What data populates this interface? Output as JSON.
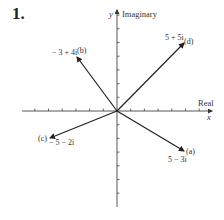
{
  "problem": {
    "number": "1."
  },
  "axes": {
    "x_label": "Real",
    "x_var": "x",
    "y_label": "Imaginary",
    "y_var": "y",
    "unit_px": 13.7,
    "origin": [
      117,
      111
    ],
    "x_ticks": [
      -6,
      -5,
      -4,
      -3,
      -2,
      -1,
      1,
      2,
      3,
      4,
      5,
      6
    ],
    "y_ticks": [
      -7,
      -6,
      -5,
      -4,
      -3,
      -2,
      -1,
      1,
      2,
      3,
      4,
      5,
      6,
      7
    ]
  },
  "vectors": [
    {
      "id": "a",
      "tag": "(a)",
      "expr": "5 − 3i",
      "re": 5,
      "im": -3
    },
    {
      "id": "b",
      "tag": "(b)",
      "expr": "− 3 + 4i",
      "re": -3,
      "im": 4
    },
    {
      "id": "c",
      "tag": "(c)",
      "expr": "− 5  − 2i",
      "re": -5,
      "im": -2
    },
    {
      "id": "d",
      "tag": "(d)",
      "expr": "5 + 5i",
      "re": 5,
      "im": 5
    }
  ],
  "colors": {
    "ink": "#222222",
    "background": "#ffffff"
  }
}
